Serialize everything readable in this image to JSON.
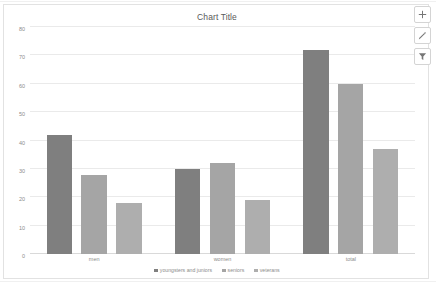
{
  "chart_object": {
    "title": "Chart Title"
  },
  "toolbar": {
    "buttons": [
      {
        "name": "chart-elements",
        "icon": "plus-icon"
      },
      {
        "name": "chart-styles",
        "icon": "brush-icon"
      },
      {
        "name": "chart-filters",
        "icon": "funnel-icon"
      }
    ]
  },
  "chart_data": {
    "type": "bar",
    "title": "Chart Title",
    "xlabel": "",
    "ylabel": "",
    "ylim": [
      0,
      80
    ],
    "yticks": [
      0,
      10,
      20,
      30,
      40,
      50,
      60,
      70,
      80
    ],
    "grid": true,
    "legend_position": "bottom",
    "categories": [
      "men",
      "women",
      "total"
    ],
    "series": [
      {
        "name": "youngsters and juniors",
        "color": "#7f7f7f",
        "values": [
          42,
          30,
          72
        ]
      },
      {
        "name": "seniors",
        "color": "#a5a5a5",
        "values": [
          28,
          32,
          60
        ]
      },
      {
        "name": "veterans",
        "color": "#aeaeae",
        "values": [
          18,
          19,
          37
        ]
      }
    ]
  }
}
